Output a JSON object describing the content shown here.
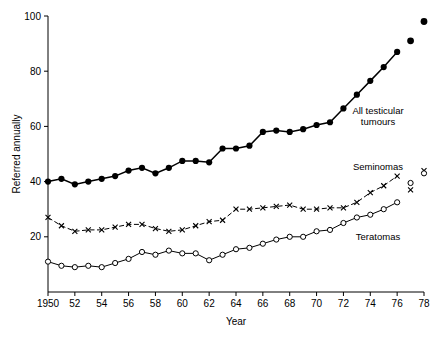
{
  "chart_data": {
    "type": "line",
    "title": "",
    "xlabel": "Year",
    "ylabel": "Referred annually",
    "xlim": [
      1950,
      1978
    ],
    "ylim": [
      0,
      100
    ],
    "xticks": [
      1950,
      1952,
      1954,
      1956,
      1958,
      1960,
      1962,
      1964,
      1966,
      1968,
      1970,
      1972,
      1974,
      1976,
      1978
    ],
    "xticklabels": [
      "1950",
      "52",
      "54",
      "56",
      "58",
      "60",
      "62",
      "64",
      "66",
      "68",
      "70",
      "72",
      "74",
      "76",
      "78"
    ],
    "yticks": [
      20,
      40,
      60,
      80,
      100
    ],
    "yticklabels": [
      "20",
      "40",
      "60",
      "80",
      "100"
    ],
    "grid": false,
    "legend_position": "inline-annotations",
    "x": [
      1950,
      1951,
      1952,
      1953,
      1954,
      1955,
      1956,
      1957,
      1958,
      1959,
      1960,
      1961,
      1962,
      1963,
      1964,
      1965,
      1966,
      1967,
      1968,
      1969,
      1970,
      1971,
      1972,
      1973,
      1974,
      1975,
      1976
    ],
    "series": [
      {
        "name": "All testicular tumours",
        "marker": "filled-circle",
        "label": "All testicular tumours",
        "label_line1": "All testicular",
        "label_line2": "tumours",
        "values": [
          40,
          41,
          39,
          40,
          41,
          42,
          44,
          45,
          43,
          45,
          47.5,
          47.5,
          47,
          52,
          52,
          53,
          58,
          58.5,
          58,
          59,
          60.5,
          61.5,
          66.5,
          71.5,
          76.5,
          81.5,
          87
        ],
        "detached_points": [
          {
            "x": 1977,
            "y": 91
          },
          {
            "x": 1978,
            "y": 98
          }
        ]
      },
      {
        "name": "Seminomas",
        "marker": "cross",
        "label": "Seminomas",
        "values": [
          27,
          24,
          22,
          22.5,
          22.5,
          23.5,
          24.5,
          24.5,
          23,
          22,
          22.5,
          24,
          25.5,
          26,
          30,
          30,
          30.5,
          31,
          31.5,
          30,
          30,
          30.5,
          30.5,
          32.5,
          36,
          38.5,
          42
        ],
        "detached_points": [
          {
            "x": 1977,
            "y": 37
          },
          {
            "x": 1978,
            "y": 44
          }
        ]
      },
      {
        "name": "Teratomas",
        "marker": "open-circle",
        "label": "Teratomas",
        "values": [
          11,
          9.5,
          9,
          9.5,
          9,
          10.5,
          12,
          14.5,
          13.5,
          15,
          14,
          14,
          11.5,
          13.5,
          15.5,
          16,
          17.5,
          19,
          20,
          20,
          22,
          22.5,
          25,
          27,
          28,
          30,
          32.5
        ],
        "detached_points": [
          {
            "x": 1977,
            "y": 39.5
          },
          {
            "x": 1978,
            "y": 43
          }
        ]
      }
    ]
  },
  "axis": {
    "x_title": "Year",
    "y_title": "Referred annually"
  }
}
